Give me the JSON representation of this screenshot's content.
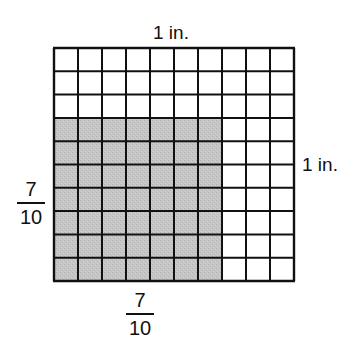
{
  "diagram": {
    "top_label": "1 in.",
    "right_label": "1 in.",
    "left_fraction": {
      "numerator": "7",
      "denominator": "10"
    },
    "bottom_fraction": {
      "numerator": "7",
      "denominator": "10"
    },
    "grid": {
      "rows": 10,
      "columns": 10,
      "shaded_rows_from_bottom": 7,
      "shaded_columns_from_left": 7,
      "shaded_cells": 49,
      "total_cells": 100
    },
    "colors": {
      "line": "#111111",
      "shade": "#c4c4c4",
      "background": "#ffffff"
    }
  }
}
